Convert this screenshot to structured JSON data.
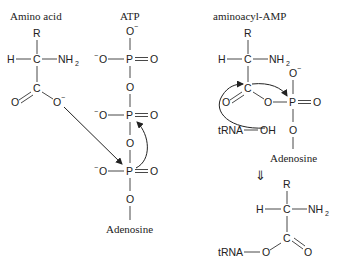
{
  "diagram": {
    "type": "chemical-reaction-mechanism",
    "headings": {
      "amino_acid": "Amino acid",
      "atp": "ATP",
      "aminoacyl_amp": "aminoacyl-AMP"
    },
    "atoms": {
      "R": "R",
      "H": "H",
      "C": "C",
      "N": "NH",
      "N_sub": "2",
      "O": "O",
      "P": "P",
      "minus": "−",
      "OH": "OH",
      "tRNA": "tRNA"
    },
    "labels": {
      "adenosine_atp": "Adenosine",
      "adenosine_amp": "Adenosine"
    },
    "transition_arrow": "⇓"
  }
}
